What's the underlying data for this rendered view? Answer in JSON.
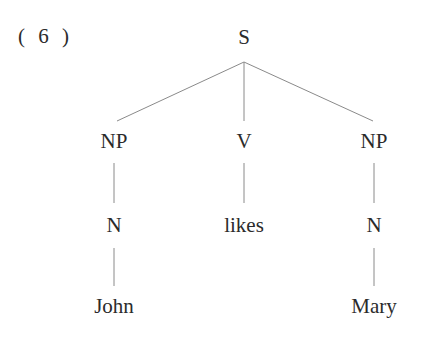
{
  "example_number": "( 6 )",
  "tree": {
    "root": "S",
    "level1": [
      "NP",
      "V",
      "NP"
    ],
    "level2": [
      "N",
      "likes",
      "N"
    ],
    "level3": [
      "John",
      "",
      "Mary"
    ]
  },
  "colors": {
    "line": "#8a8a8a",
    "text": "#2b2b2b"
  }
}
